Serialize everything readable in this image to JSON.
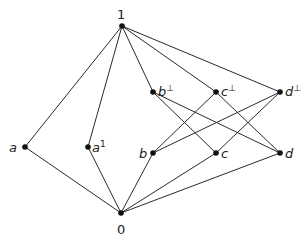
{
  "diagram": {
    "type": "hasse-diagram",
    "colors": {
      "line": "#2a2a2a",
      "node": "#111111",
      "text": "#222222",
      "background": "#ffffff"
    },
    "nodes": [
      {
        "id": "top",
        "label": "1",
        "sup": "",
        "x": 122,
        "y": 26,
        "lx": 117,
        "ly": 19,
        "italic": false
      },
      {
        "id": "a",
        "label": "a",
        "sup": "",
        "x": 25,
        "y": 147,
        "lx": 9,
        "ly": 152,
        "italic": true
      },
      {
        "id": "a1",
        "label": "a",
        "sup": "1",
        "x": 88,
        "y": 147,
        "lx": 92,
        "ly": 152,
        "italic": true
      },
      {
        "id": "bperp",
        "label": "b",
        "sup": "⊥",
        "x": 153,
        "y": 92,
        "lx": 158,
        "ly": 96,
        "italic": true
      },
      {
        "id": "cperp",
        "label": "c",
        "sup": "⊥",
        "x": 216,
        "y": 92,
        "lx": 221,
        "ly": 96,
        "italic": true
      },
      {
        "id": "dperp",
        "label": "d",
        "sup": "⊥",
        "x": 280,
        "y": 92,
        "lx": 285,
        "ly": 96,
        "italic": true
      },
      {
        "id": "b",
        "label": "b",
        "sup": "",
        "x": 153,
        "y": 153,
        "lx": 139,
        "ly": 158,
        "italic": true
      },
      {
        "id": "c",
        "label": "c",
        "sup": "",
        "x": 216,
        "y": 153,
        "lx": 221,
        "ly": 158,
        "italic": true
      },
      {
        "id": "d",
        "label": "d",
        "sup": "",
        "x": 280,
        "y": 153,
        "lx": 285,
        "ly": 158,
        "italic": true
      },
      {
        "id": "bottom",
        "label": "0",
        "sup": "",
        "x": 121,
        "y": 213,
        "lx": 117,
        "ly": 234,
        "italic": false
      }
    ],
    "edges": [
      [
        "top",
        "a"
      ],
      [
        "top",
        "a1"
      ],
      [
        "top",
        "bperp"
      ],
      [
        "top",
        "cperp"
      ],
      [
        "top",
        "dperp"
      ],
      [
        "a",
        "bottom"
      ],
      [
        "a1",
        "bottom"
      ],
      [
        "b",
        "bottom"
      ],
      [
        "c",
        "bottom"
      ],
      [
        "d",
        "bottom"
      ],
      [
        "bperp",
        "c"
      ],
      [
        "bperp",
        "d"
      ],
      [
        "cperp",
        "b"
      ],
      [
        "cperp",
        "d"
      ],
      [
        "dperp",
        "b"
      ],
      [
        "dperp",
        "c"
      ]
    ]
  }
}
